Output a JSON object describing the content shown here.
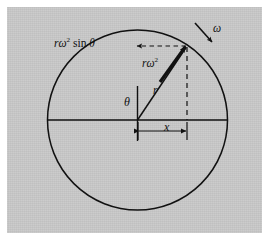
{
  "figure": {
    "kind": "physics-diagram",
    "background_color": "#ffffff",
    "panel_color": "#c9c9c9",
    "ink_color": "#111111"
  },
  "labels": {
    "accel_component": {
      "base": "r",
      "omega": "ω",
      "exponent": "2",
      "trig": " sin ",
      "angle": "θ"
    },
    "accel_vector": {
      "base": "r",
      "omega": "ω",
      "exponent": "2"
    },
    "angular_velocity": "ω",
    "radius": "r",
    "angle": "θ",
    "horizontal_projection": "x"
  },
  "geometry": {
    "circle": {
      "cx": 137.5,
      "cy": 120,
      "r": 90
    },
    "center_point": {
      "x": 137.5,
      "y": 120
    },
    "particle_point": {
      "x": 187,
      "y": 46
    },
    "horizontal_axis": {
      "x1": 47.5,
      "y1": 120,
      "x2": 227.5,
      "y2": 120
    },
    "vertical_reference": {
      "x1": 137.5,
      "y1": 86,
      "x2": 137.5,
      "y2": 141
    },
    "radius_line": {
      "x1": 137.5,
      "y1": 120,
      "x2": 187,
      "y2": 46
    },
    "dashed_vertical": {
      "x1": 187,
      "y1": 46,
      "x2": 187,
      "y2": 120
    },
    "dashed_horizontal_arrow": {
      "x1": 187,
      "y1": 46,
      "x2": 136,
      "y2": 46
    },
    "dimension_line": {
      "x1": 138,
      "y1": 131,
      "x2": 187,
      "y2": 131
    },
    "omega_arrow": {
      "x1": 196,
      "y1": 24,
      "x2": 213,
      "y2": 43
    }
  }
}
